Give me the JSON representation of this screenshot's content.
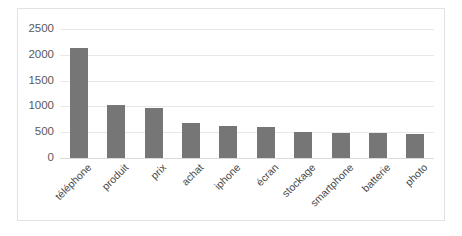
{
  "chart_data": {
    "type": "bar",
    "title": "",
    "subtitle": "",
    "xlabel": "",
    "ylabel": "",
    "categories": [
      "téléphone",
      "produit",
      "prix",
      "achat",
      "iphone",
      "écran",
      "stockage",
      "smartphone",
      "batterie",
      "photo"
    ],
    "values": [
      2130,
      1020,
      970,
      670,
      620,
      610,
      510,
      490,
      480,
      460
    ],
    "series": [
      {
        "name": "",
        "values": [
          2130,
          1020,
          970,
          670,
          620,
          610,
          510,
          490,
          480,
          460
        ]
      }
    ],
    "ylim": [
      0,
      2500
    ],
    "yticks": [
      0,
      500,
      1000,
      1500,
      2000,
      2500
    ],
    "ytick_labels": [
      "0",
      "500",
      "1000",
      "1500",
      "2000",
      "2500"
    ],
    "grid": "horizontal",
    "legend": "none",
    "bar_color": "#767676",
    "grid_color": "#e8e8e8",
    "axis_color": "#d9d9d9",
    "border_color": "#e2e2e2",
    "background": "#ffffff"
  }
}
